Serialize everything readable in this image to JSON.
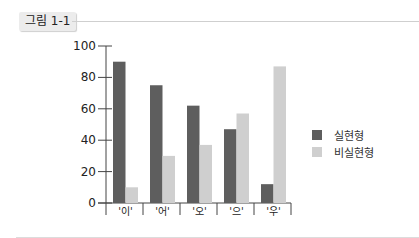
{
  "figure": {
    "tag": "그림 1-1"
  },
  "colors": {
    "realized": "#5e5e5e",
    "unrealized": "#cfcfcf",
    "axis": "#444444"
  },
  "chart_data": {
    "type": "bar",
    "title": "",
    "xlabel": "",
    "ylabel": "",
    "ylim": [
      0,
      100
    ],
    "yticks": [
      0,
      20,
      40,
      60,
      80,
      100
    ],
    "categories": [
      "'이'",
      "'어'",
      "'오'",
      "'으'",
      "'우'"
    ],
    "series": [
      {
        "name": "실현형",
        "values": [
          90,
          75,
          62,
          47,
          12
        ]
      },
      {
        "name": "비실현형",
        "values": [
          10,
          30,
          37,
          57,
          87
        ]
      }
    ],
    "grid": false,
    "legend_position": "right"
  },
  "legend": {
    "items": [
      "실현형",
      "비실현형"
    ]
  }
}
